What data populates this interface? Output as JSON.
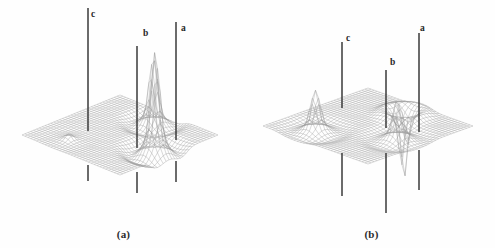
{
  "figure": {
    "title": "",
    "background_color": "#ffffff",
    "line_color": "#3a3a3a",
    "mesh_color": "#9a9a9a"
  },
  "panels": [
    {
      "id": "a",
      "caption": "(a)",
      "labels": [
        {
          "text": "c",
          "x": 91,
          "y": 10
        },
        {
          "text": "b",
          "x": 143,
          "y": 29
        },
        {
          "text": "a",
          "x": 181,
          "y": 24
        }
      ],
      "markers": [
        {
          "name": "c",
          "x": 88,
          "top": 8,
          "bottom": 131,
          "stub_top": 165,
          "stub_bottom": 181
        },
        {
          "name": "b",
          "x": 137,
          "top": 46,
          "bottom": 148,
          "stub_top": 172,
          "stub_bottom": 193
        },
        {
          "name": "a",
          "x": 176,
          "top": 22,
          "bottom": 140,
          "stub_top": 161,
          "stub_bottom": 182
        }
      ],
      "peaks": [
        {
          "name": "c",
          "direction": "up",
          "height": 6,
          "width": 20,
          "px": 88,
          "py": 131
        },
        {
          "name": "b",
          "direction": "up",
          "height": 96,
          "width": 26,
          "px": 137,
          "py": 148
        },
        {
          "name": "a",
          "direction": "up",
          "height": 62,
          "width": 24,
          "px": 176,
          "py": 140
        }
      ]
    },
    {
      "id": "b",
      "caption": "(b)",
      "labels": [
        {
          "text": "c",
          "x": 346,
          "y": 34
        },
        {
          "text": "b",
          "x": 390,
          "y": 58
        },
        {
          "text": "a",
          "x": 420,
          "y": 24
        }
      ],
      "markers": [
        {
          "name": "c",
          "x": 342,
          "top": 42,
          "bottom": 108,
          "stub_top": 153,
          "stub_bottom": 196
        },
        {
          "name": "b",
          "x": 386,
          "top": 70,
          "bottom": 128,
          "stub_top": 153,
          "stub_bottom": 213
        },
        {
          "name": "a",
          "x": 419,
          "top": 33,
          "bottom": 132,
          "stub_top": 150,
          "stub_bottom": 190
        }
      ],
      "peaks": [
        {
          "name": "c",
          "direction": "up",
          "height": 38,
          "width": 24,
          "px": 342,
          "py": 108
        },
        {
          "name": "b",
          "direction": "up",
          "height": 36,
          "width": 24,
          "px": 386,
          "py": 128
        },
        {
          "name": "a",
          "direction": "down",
          "height": 62,
          "width": 18,
          "px": 419,
          "py": 132
        }
      ]
    }
  ],
  "chart_data": {
    "type": "surface",
    "title": "",
    "xlabel": "",
    "ylabel": "",
    "subplots": [
      {
        "id": "(a)",
        "peaks": [
          {
            "label": "a",
            "amplitude": 0.65,
            "sign": "positive"
          },
          {
            "label": "b",
            "amplitude": 1.0,
            "sign": "positive"
          },
          {
            "label": "c",
            "amplitude": 0.06,
            "sign": "positive"
          }
        ]
      },
      {
        "id": "(b)",
        "peaks": [
          {
            "label": "a",
            "amplitude": -0.65,
            "sign": "negative"
          },
          {
            "label": "b",
            "amplitude": 0.38,
            "sign": "positive"
          },
          {
            "label": "c",
            "amplitude": 0.4,
            "sign": "positive"
          }
        ]
      }
    ]
  }
}
